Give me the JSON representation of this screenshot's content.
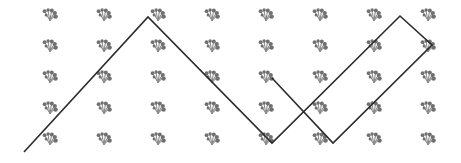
{
  "canvas": {
    "width": 461,
    "height": 163,
    "background_color": "#ffffff",
    "title": "Zigzag polyline over repeating floral sprig pattern"
  },
  "pattern": {
    "name": "floral-sprig-motif",
    "motif_label": "floral sprig",
    "stem_color": "#8c8c8c",
    "dot_color": "#707070",
    "columns": 8,
    "rows": 5,
    "origin_x": 50,
    "origin_y": 17,
    "spacing_x": 54,
    "spacing_y": 31,
    "motif_scale": 1.0,
    "column_centers": [
      50,
      104,
      158,
      212,
      266,
      320,
      374,
      428
    ],
    "row_centers": [
      17,
      48,
      79,
      110,
      141
    ]
  },
  "polyline": {
    "name": "zigzag-path",
    "stroke_color": "#2b2b2b",
    "stroke_width": 1.6,
    "closed": false,
    "points": [
      [
        24,
        152
      ],
      [
        148,
        17
      ],
      [
        272,
        143
      ],
      [
        400,
        16
      ],
      [
        432,
        45
      ],
      [
        333,
        143
      ],
      [
        272,
        78
      ]
    ],
    "vertex_labels": [
      "start-bottom-left",
      "peak-left",
      "valley-left",
      "peak-right",
      "corner-far-right",
      "valley-right",
      "end-middle"
    ]
  }
}
